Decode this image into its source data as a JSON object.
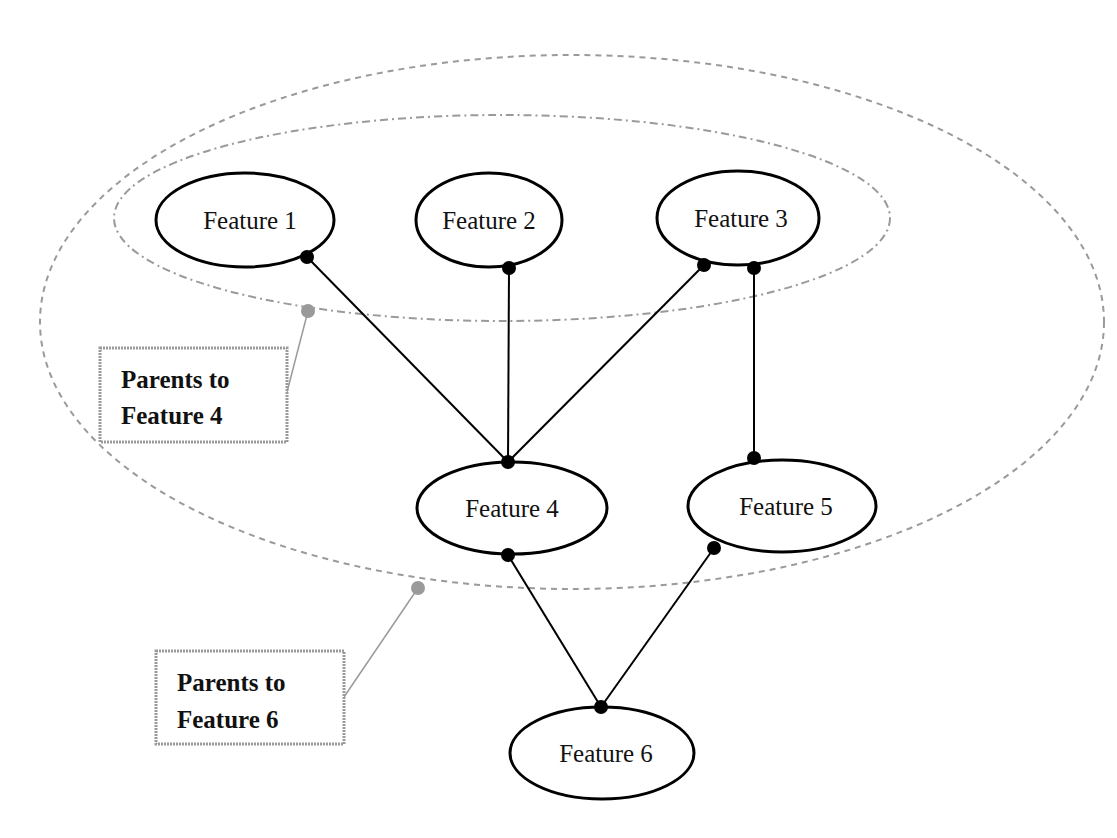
{
  "diagram": {
    "type": "directed-graph",
    "nodes": [
      {
        "id": "f1",
        "label": "Feature 1"
      },
      {
        "id": "f2",
        "label": "Feature 2"
      },
      {
        "id": "f3",
        "label": "Feature 3"
      },
      {
        "id": "f4",
        "label": "Feature 4"
      },
      {
        "id": "f5",
        "label": "Feature 5"
      },
      {
        "id": "f6",
        "label": "Feature 6"
      }
    ],
    "edges": [
      {
        "from": "f1",
        "to": "f4"
      },
      {
        "from": "f2",
        "to": "f4"
      },
      {
        "from": "f3",
        "to": "f4"
      },
      {
        "from": "f3",
        "to": "f5"
      },
      {
        "from": "f4",
        "to": "f6"
      },
      {
        "from": "f5",
        "to": "f6"
      }
    ],
    "groups": [
      {
        "id": "parents-f4",
        "members": [
          "f1",
          "f2",
          "f3"
        ],
        "style": "dash-dot",
        "callout": [
          "Parents to",
          "Feature 4"
        ]
      },
      {
        "id": "parents-f6",
        "members": [
          "f1",
          "f2",
          "f3",
          "f4",
          "f5"
        ],
        "style": "dashed",
        "callout": [
          "Parents to",
          "Feature 6"
        ]
      }
    ]
  },
  "colors": {
    "node_stroke": "#000000",
    "group_stroke": "#9a9a9a",
    "background": "#ffffff"
  }
}
